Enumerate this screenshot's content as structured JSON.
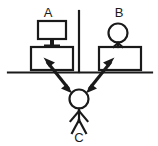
{
  "diagram": {
    "background_color": "#ffffff",
    "ink_color": "#1a1a1a",
    "labels": {
      "a": "A",
      "b": "B",
      "c": "C"
    },
    "nodes": [
      {
        "id": "A",
        "label": "A",
        "kind": "computer-monitor-on-desk",
        "side": "left",
        "description": "Computer monitor with stand sitting on a desk"
      },
      {
        "id": "B",
        "label": "B",
        "kind": "person-behind-desk",
        "side": "right",
        "description": "Stick figure person standing behind a desk"
      },
      {
        "id": "C",
        "label": "C",
        "kind": "standing-person",
        "side": "bottom-center",
        "description": "Stick figure person standing in front of the counter"
      }
    ],
    "connectors": [
      {
        "id": "c-to-a",
        "from": "C",
        "to": "A",
        "style": "double-headed-arrow"
      },
      {
        "id": "c-to-b",
        "from": "C",
        "to": "B",
        "style": "double-headed-arrow"
      }
    ],
    "separators": [
      {
        "id": "counter-line",
        "orientation": "horizontal",
        "description": "Horizontal counter line spanning full width"
      },
      {
        "id": "partition-line",
        "orientation": "vertical",
        "description": "Vertical partition dividing station A from station B"
      }
    ]
  }
}
